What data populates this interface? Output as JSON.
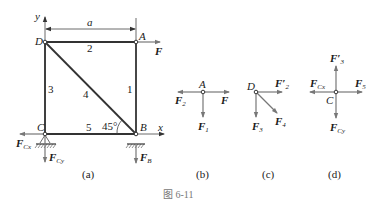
{
  "figure": {
    "caption": "图 6-11",
    "colors": {
      "member": "#333333",
      "force_arrow": "#777777",
      "text": "#1a1a1a"
    }
  },
  "panel_a": {
    "label": "(a)",
    "dimension": "a",
    "axis_x": "x",
    "axis_y": "y",
    "nodes": {
      "A": "A",
      "B": "B",
      "C": "C",
      "D": "D"
    },
    "members": [
      "1",
      "2",
      "3",
      "4",
      "5"
    ],
    "angle": "45°",
    "forces": {
      "F": {
        "main": "F",
        "sub": ""
      },
      "FCx": {
        "main": "F",
        "sub": "Cx"
      },
      "FCy": {
        "main": "F",
        "sub": "Cy"
      },
      "FB": {
        "main": "F",
        "sub": "B"
      }
    }
  },
  "panel_b": {
    "label": "(b)",
    "node": "A",
    "forces": {
      "F2": {
        "main": "F",
        "sub": "2"
      },
      "F": {
        "main": "F",
        "sub": ""
      },
      "F1": {
        "main": "F",
        "sub": "1"
      }
    }
  },
  "panel_c": {
    "label": "(c)",
    "node": "D",
    "forces": {
      "F2p": {
        "main": "F′",
        "sub": "2"
      },
      "F3": {
        "main": "F",
        "sub": "3"
      },
      "F4": {
        "main": "F",
        "sub": "4"
      }
    }
  },
  "panel_d": {
    "label": "(d)",
    "node": "C",
    "forces": {
      "F3p": {
        "main": "F′",
        "sub": "3"
      },
      "FCx": {
        "main": "F",
        "sub": "Cx"
      },
      "F5": {
        "main": "F",
        "sub": "5"
      },
      "FCy": {
        "main": "F",
        "sub": "Cy"
      }
    }
  }
}
